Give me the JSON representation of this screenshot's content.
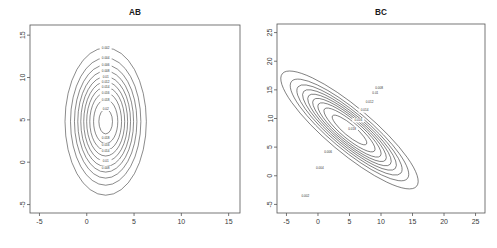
{
  "figure": {
    "kind": "contour-plot-pair",
    "background": "#ffffff",
    "line_color": "#2b2b2b",
    "axis_color": "#555555",
    "text_color": "#1a1a1a"
  },
  "panels": [
    {
      "id": "ab",
      "title": "AB"
    },
    {
      "id": "bc",
      "title": "BC"
    }
  ],
  "chart_data": [
    {
      "type": "contour",
      "title": "AB",
      "xlabel": "",
      "ylabel": "",
      "xlim": [
        -6.0,
        16.2
      ],
      "ylim": [
        -6.0,
        16.2
      ],
      "xticks": [
        -5,
        0,
        5,
        10,
        15
      ],
      "xticklabels": [
        "-5",
        "0",
        "5",
        "10",
        "15"
      ],
      "yticks": [
        -5,
        0,
        5,
        10,
        15
      ],
      "yticklabels": [
        "-5",
        "0",
        "5",
        "10",
        "15"
      ],
      "grid": false,
      "legend": "none",
      "description": "Nested concentric upright ellipses (bivariate normal density contours), elongated along the vertical axis.",
      "center": [
        2.0,
        4.8
      ],
      "orientation_deg": 0,
      "levels": [
        0.002,
        0.004,
        0.006,
        0.008,
        0.01,
        0.012,
        0.014,
        0.016,
        0.018,
        0.02
      ],
      "level_labels": [
        "0.002",
        "0.004",
        "0.006",
        "0.008",
        "0.01",
        "0.012",
        "0.014",
        "0.016",
        "0.018",
        "0.02"
      ],
      "rings": [
        {
          "level": 0.002,
          "label": "0.002",
          "rx": 4.3,
          "ry": 8.7,
          "label_pos": [
            2.0,
            13.5
          ]
        },
        {
          "level": 0.004,
          "label": "0.004",
          "rx": 3.72,
          "ry": 7.52,
          "label_pos": [
            2.0,
            12.3
          ]
        },
        {
          "level": 0.006,
          "label": "0.006",
          "rx": 3.3,
          "ry": 6.68,
          "label_pos": [
            2.0,
            11.5
          ]
        },
        {
          "level": 0.008,
          "label": "0.008",
          "rx": 2.95,
          "ry": 5.97,
          "label_pos": [
            2.0,
            10.8
          ]
        },
        {
          "level": 0.01,
          "label": "0.01",
          "rx": 2.63,
          "ry": 5.32,
          "label_pos": [
            2.0,
            10.1
          ]
        },
        {
          "level": 0.012,
          "label": "0.012",
          "rx": 2.32,
          "ry": 4.7,
          "label_pos": [
            2.0,
            9.5
          ]
        },
        {
          "level": 0.014,
          "label": "0.014",
          "rx": 2.01,
          "ry": 4.07,
          "label_pos": [
            2.0,
            8.9
          ]
        },
        {
          "level": 0.016,
          "label": "0.016",
          "rx": 1.68,
          "ry": 3.4,
          "label_pos": [
            2.0,
            8.2
          ]
        },
        {
          "level": 0.018,
          "label": "0.018",
          "rx": 1.28,
          "ry": 2.6,
          "label_pos": [
            2.0,
            7.4
          ]
        },
        {
          "level": 0.02,
          "label": "0.02",
          "rx": 0.72,
          "ry": 1.46,
          "label_pos": [
            2.0,
            6.3
          ]
        }
      ],
      "inner_labels": [
        {
          "label": "0.018",
          "pos": [
            2.0,
            2.9
          ]
        },
        {
          "label": "0.016",
          "pos": [
            2.0,
            2.0
          ]
        },
        {
          "label": "0.014",
          "pos": [
            2.0,
            1.3
          ]
        },
        {
          "label": "0.01",
          "pos": [
            2.0,
            0.1
          ]
        },
        {
          "label": "0.008",
          "pos": [
            2.0,
            -0.7
          ]
        }
      ]
    },
    {
      "type": "contour",
      "title": "BC",
      "xlabel": "",
      "ylabel": "",
      "xlim": [
        -6.5,
        26.5
      ],
      "ylim": [
        -6.5,
        26.5
      ],
      "xticks": [
        -5,
        0,
        5,
        10,
        15,
        20,
        25
      ],
      "xticklabels": [
        "-5",
        "0",
        "5",
        "10",
        "15",
        "20",
        "25"
      ],
      "yticks": [
        -5,
        0,
        5,
        10,
        15,
        20,
        25
      ],
      "yticklabels": [
        "-5",
        "0",
        "5",
        "10",
        "15",
        "20",
        "25"
      ],
      "grid": false,
      "legend": "none",
      "description": "Nested concentric ellipses tilted about 50 degrees (strongly positively correlated bivariate normal density contours).",
      "center": [
        5.0,
        8.0
      ],
      "orientation_deg": 50,
      "levels": [
        0.002,
        0.004,
        0.006,
        0.008,
        0.01,
        0.012,
        0.014,
        0.016,
        0.018
      ],
      "level_labels": [
        "0.002",
        "0.004",
        "0.006",
        "0.008",
        "0.01",
        "0.012",
        "0.014",
        "0.016",
        "0.018"
      ],
      "rings": [
        {
          "level": 0.002,
          "label": "0.002",
          "rx": 3.6,
          "ry": 15.3,
          "label_pos": [
            -2.0,
            -3.6
          ]
        },
        {
          "level": 0.004,
          "label": "0.004",
          "rx": 3.11,
          "ry": 13.2,
          "label_pos": [
            0.3,
            1.4
          ]
        },
        {
          "level": 0.006,
          "label": "0.006",
          "rx": 2.76,
          "ry": 11.72,
          "label_pos": [
            1.6,
            4.2
          ]
        },
        {
          "level": 0.008,
          "label": "0.008",
          "rx": 2.46,
          "ry": 10.45,
          "label_pos": [
            9.7,
            15.3
          ]
        },
        {
          "level": 0.01,
          "label": "0.01",
          "rx": 2.19,
          "ry": 9.3,
          "label_pos": [
            9.1,
            14.4
          ]
        },
        {
          "level": 0.012,
          "label": "0.012",
          "rx": 1.93,
          "ry": 8.2,
          "label_pos": [
            8.2,
            12.8
          ]
        },
        {
          "level": 0.014,
          "label": "0.014",
          "rx": 1.66,
          "ry": 7.05,
          "label_pos": [
            7.4,
            11.4
          ]
        },
        {
          "level": 0.016,
          "label": "0.016",
          "rx": 1.34,
          "ry": 5.7,
          "label_pos": [
            6.4,
            9.7
          ]
        },
        {
          "level": 0.018,
          "label": "0.018",
          "rx": 0.9,
          "ry": 3.85,
          "label_pos": [
            5.4,
            8.2
          ]
        }
      ],
      "inner_labels": []
    }
  ]
}
